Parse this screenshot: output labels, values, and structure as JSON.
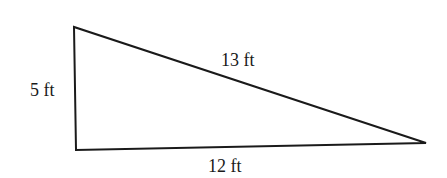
{
  "diagram": {
    "type": "right-triangle",
    "vertices": {
      "top_left": [
        74,
        27
      ],
      "bottom_left": [
        76,
        150
      ],
      "right": [
        426,
        143
      ]
    },
    "stroke_color": "#1a1a1a",
    "background": "#ffffff",
    "labels": {
      "vertical_side": "5 ft",
      "hypotenuse": "13 ft",
      "base": "12 ft"
    }
  }
}
